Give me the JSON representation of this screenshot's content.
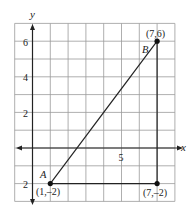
{
  "diagram": {
    "type": "coordinate-plane",
    "axes": {
      "x_label": "x",
      "y_label": "y",
      "x_tick_label": "5",
      "y_tick_labels": [
        "6",
        "4",
        "2",
        "2"
      ]
    },
    "grid": {
      "x_min": -1,
      "x_max": 8,
      "y_min": -3,
      "y_max": 7
    },
    "points": [
      {
        "name": "A",
        "coords_label": "(1,–2)",
        "x": 1,
        "y": -2
      },
      {
        "name": "B",
        "coords_label": "(7,6)",
        "x": 7,
        "y": 6
      },
      {
        "name": "",
        "coords_label": "(7,–2)",
        "x": 7,
        "y": -2
      }
    ],
    "segments": [
      {
        "from": "A",
        "to": "B"
      },
      {
        "from": "A",
        "to": "(7,-2)"
      },
      {
        "from": "(7,-2)",
        "to": "B"
      }
    ],
    "colors": {
      "grid": "#9a9a9a",
      "axis": "#222222",
      "line": "#222222"
    }
  }
}
